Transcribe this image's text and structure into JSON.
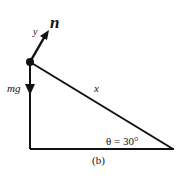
{
  "diagram": {
    "caption": "(b)",
    "labels": {
      "normal_force": "n",
      "axis_y": "y",
      "weight": "mg",
      "axis_x": "x",
      "angle": "θ = 30°"
    },
    "colors": {
      "line": "#111111",
      "background": "#ffffff"
    }
  }
}
